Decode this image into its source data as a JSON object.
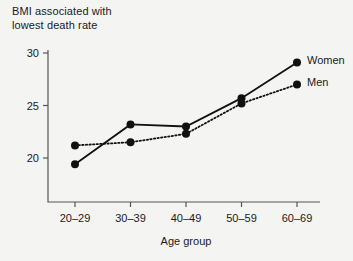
{
  "chart_data": {
    "type": "line",
    "title": "BMI associated with\nlowest death rate",
    "xlabel": "Age group",
    "ylabel": "",
    "categories": [
      "20–29",
      "30–39",
      "40–49",
      "50–59",
      "60–69"
    ],
    "series": [
      {
        "name": "Women",
        "style": "solid",
        "values": [
          19.4,
          23.2,
          23.0,
          25.7,
          29.1
        ]
      },
      {
        "name": "Men",
        "style": "dotted",
        "values": [
          21.2,
          21.5,
          22.3,
          25.2,
          27.0
        ]
      }
    ],
    "ylim": [
      16.5,
      30.8
    ],
    "yticks": [
      20,
      25,
      30
    ],
    "ytick_labels": [
      "20",
      "25",
      "30"
    ],
    "grid": false,
    "legend_position": "right-inline",
    "axis_style": "left-and-bottom-spines"
  },
  "colors": {
    "background": "#f4f4f2",
    "ink": "#111111",
    "axis": "#555555"
  }
}
